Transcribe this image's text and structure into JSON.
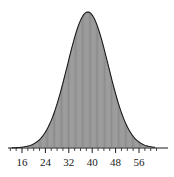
{
  "chart_data": {
    "type": "bar",
    "title": "",
    "subtitle": "",
    "xlabel": "",
    "ylabel": "",
    "grid": false,
    "legend": null,
    "axis": {
      "x_ticks": [
        16,
        24,
        32,
        40,
        48,
        56
      ],
      "x_tick_labels": [
        "16",
        "24",
        "32",
        "40",
        "48",
        "56"
      ],
      "xlim": [
        12,
        62
      ],
      "ylim": [
        0,
        1.0
      ],
      "y_axis_visible": false,
      "x_axis_visible": true,
      "minor_ticks": true
    },
    "distribution": {
      "shape": "normal",
      "mean": 38.5,
      "std_dev": 7.0,
      "peak_x": 38.5,
      "peak_value": 1.0
    },
    "categories": [
      14,
      15,
      16,
      17,
      18,
      19,
      20,
      21,
      22,
      23,
      24,
      25,
      26,
      27,
      28,
      29,
      30,
      31,
      32,
      33,
      34,
      35,
      36,
      37,
      38,
      39,
      40,
      41,
      42,
      43,
      44,
      45,
      46,
      47,
      48,
      49,
      50,
      51,
      52,
      53,
      54,
      55,
      56,
      57,
      58,
      59,
      60
    ],
    "values": [
      0.003,
      0.005,
      0.008,
      0.012,
      0.018,
      0.027,
      0.038,
      0.053,
      0.072,
      0.096,
      0.125,
      0.159,
      0.199,
      0.244,
      0.294,
      0.348,
      0.405,
      0.463,
      0.522,
      0.593,
      0.661,
      0.741,
      0.812,
      0.88,
      0.945,
      0.985,
      1.0,
      0.985,
      0.945,
      0.88,
      0.812,
      0.741,
      0.661,
      0.593,
      0.522,
      0.463,
      0.405,
      0.348,
      0.294,
      0.244,
      0.199,
      0.159,
      0.125,
      0.096,
      0.06,
      0.032,
      0.012
    ],
    "colors": {
      "bar_line": "#555555",
      "curve": "#1a1a1a",
      "axis": "#1a1a1a",
      "background": "#ffffff",
      "label": "#1a1a1a"
    }
  }
}
